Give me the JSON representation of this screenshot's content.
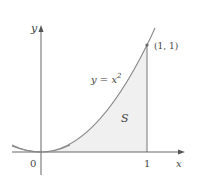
{
  "figure": {
    "curve_label": "y = x",
    "curve_exponent": "2",
    "point_label": "(1, 1)",
    "region_label": "S",
    "x_axis_label": "x",
    "y_axis_label": "y",
    "origin_label": "0",
    "x_tick_label": "1",
    "colors": {
      "axis": "#555555",
      "curve": "#888888",
      "region_fill": "#f0f0f0",
      "text": "#444444"
    }
  }
}
